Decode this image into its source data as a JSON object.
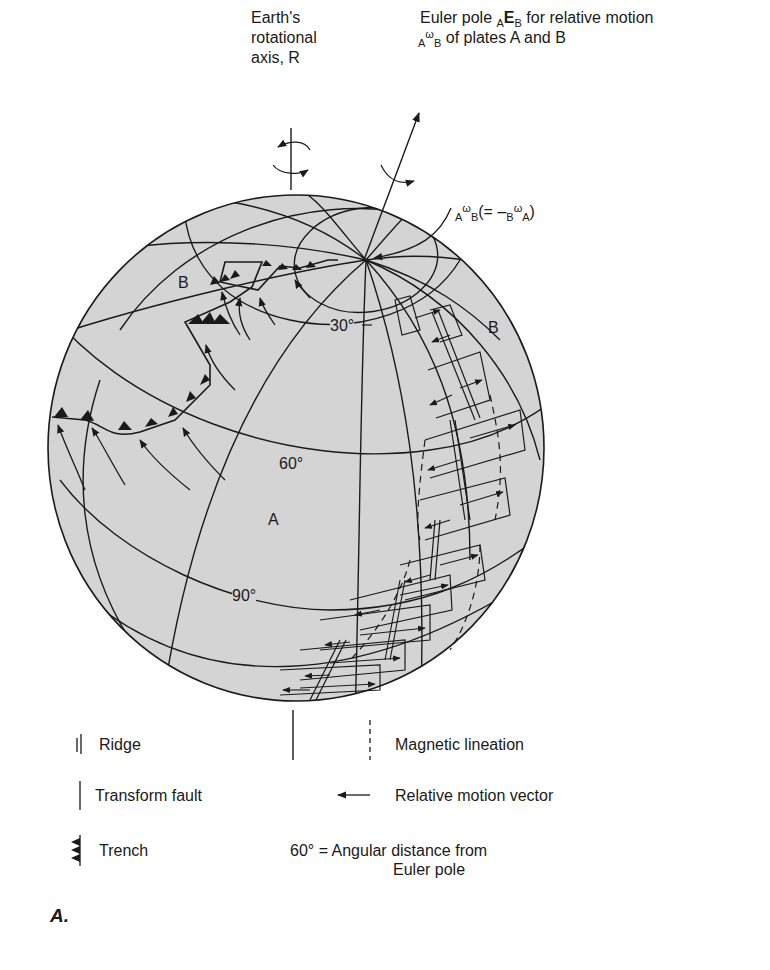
{
  "title": {
    "earth_axis": [
      "Earth's",
      "rotational",
      "axis, R"
    ],
    "euler_pole_line1_pre": "Euler pole ",
    "euler_pole_sub_a": "A",
    "euler_pole_E": "E",
    "euler_pole_sub_b": "B",
    "euler_pole_line1_post": " for relative motion",
    "euler_pole_line2_sub_a": "A",
    "euler_pole_line2_omega": "ω",
    "euler_pole_line2_sub_b": "B",
    "euler_pole_line2_post": " of plates A and B"
  },
  "omega_label": {
    "sub_a": "A",
    "omega": "ω",
    "sub_b": "B",
    "middle": "(= –",
    "sub_b2": "B",
    "omega2": "ω",
    "sub_a2": "A",
    "close": ")"
  },
  "plates": {
    "b_left": "B",
    "b_right": "B",
    "a": "A"
  },
  "angles": {
    "a30": "30°",
    "a60": "60°",
    "a90": "90°"
  },
  "legend": {
    "ridge": "Ridge",
    "transform_fault": "Transform fault",
    "trench": "Trench",
    "magnetic_lineation": "Magnetic lineation",
    "relative_motion_vector": "Relative motion vector",
    "angular_distance_line1": "60° = Angular distance from",
    "angular_distance_line2": "Euler pole"
  },
  "figure_label": "A.",
  "colors": {
    "sphere_fill": "#d4d4d4",
    "line": "#1a1a1a",
    "background": "#ffffff"
  }
}
